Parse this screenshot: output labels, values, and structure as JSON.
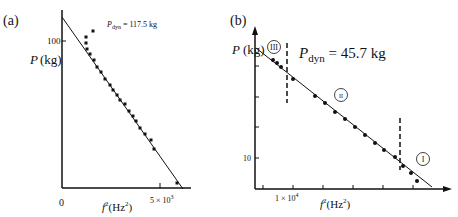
{
  "chart_data": [
    {
      "panel": "(a)",
      "type": "scatter",
      "annotation": "P_dyn = 117.5 kg",
      "annotation_main": "P",
      "annotation_sub": "dyn",
      "annotation_value": " = 117.5 kg",
      "xlabel": "f²(Hz²)",
      "xlabel_main": "f",
      "xlabel_sup": "2",
      "xlabel_unit": "(Hz",
      "xlabel_unit_sup": "2",
      "xlabel_close": ")",
      "ylabel": "P (kg)",
      "x_ticks": [
        "0",
        "5 × 10³"
      ],
      "x_tick_zero": "0",
      "x_tick_main": "5 × 10",
      "x_tick_sup": "3",
      "y_ticks": [
        "100"
      ],
      "y_tick_100": "100",
      "fit_line": "linear",
      "points_px": [
        [
          86,
          37
        ],
        [
          93,
          31
        ],
        [
          86,
          43
        ],
        [
          87,
          49
        ],
        [
          90,
          54
        ],
        [
          94,
          60
        ],
        [
          97,
          67
        ],
        [
          101,
          72
        ],
        [
          105,
          79
        ],
        [
          110,
          85
        ],
        [
          113,
          90
        ],
        [
          117,
          95
        ],
        [
          120,
          100
        ],
        [
          125,
          104
        ],
        [
          129,
          111
        ],
        [
          133,
          116
        ],
        [
          136,
          121
        ],
        [
          140,
          128
        ],
        [
          145,
          134
        ],
        [
          151,
          140
        ],
        [
          154,
          149
        ],
        [
          177,
          183
        ]
      ]
    },
    {
      "panel": "(b)",
      "type": "scatter",
      "annotation": "P_dyn = 45.7 kg",
      "annotation_main": "P",
      "annotation_sub": "dyn",
      "annotation_value": " = 45.7 kg",
      "xlabel": "f²(Hz²)",
      "xlabel_main": "f",
      "xlabel_sup": "2",
      "xlabel_unit": "(Hz",
      "xlabel_unit_sup": "2",
      "xlabel_close": ")",
      "ylabel": "P (kg)",
      "x_ticks": [
        "1 × 10⁴"
      ],
      "x_tick_main": "1 × 10",
      "x_tick_sup": "4",
      "y_ticks": [
        "10"
      ],
      "y_tick_10": "10",
      "regions": [
        "III",
        "II",
        "I"
      ],
      "fit_line": "linear",
      "points_px": [
        [
          273,
          60
        ],
        [
          277,
          63
        ],
        [
          281,
          67
        ],
        [
          293,
          79
        ],
        [
          315,
          96
        ],
        [
          325,
          103
        ],
        [
          335,
          112
        ],
        [
          345,
          119
        ],
        [
          355,
          127
        ],
        [
          365,
          135
        ],
        [
          375,
          143
        ],
        [
          384,
          150
        ],
        [
          395,
          157
        ],
        [
          403,
          166
        ],
        [
          411,
          173
        ],
        [
          417,
          181
        ]
      ]
    }
  ]
}
